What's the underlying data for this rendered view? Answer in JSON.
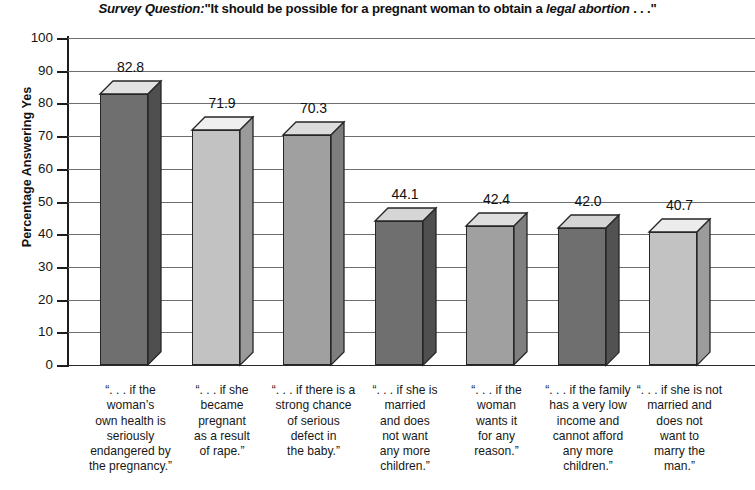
{
  "chart_data": {
    "type": "bar",
    "title_parts": {
      "lead": "Survey Question:",
      "quote_open": "\"It should be possible for a pregnant woman to obtain a ",
      "emphasis": "legal abortion",
      "quote_close": " . . .\""
    },
    "xlabel": "",
    "ylabel": "Percentage Answering Yes",
    "ylim": [
      0,
      100
    ],
    "ytick_step": 10,
    "yticks": [
      100,
      90,
      80,
      70,
      60,
      50,
      40,
      30,
      20,
      10,
      0
    ],
    "grid": true,
    "legend": "none",
    "categories": [
      "“. . . if the woman’s own health is seriously endangered by the pregnancy.”",
      "“. . . if she became pregnant as a result of rape.”",
      "“. . . if there is a strong chance of serious defect in the baby.”",
      "“. . . if she is married and does not want any more children.”",
      "“. . . if the woman wants it for any reason.”",
      "“. . . if the family has a very low income and cannot afford any more children.”",
      "“. . . if she is not married and does not want to marry the man.”"
    ],
    "category_lines": [
      [
        "“. . . if the",
        "woman’s",
        "own health is",
        "seriously",
        "endangered by",
        "the pregnancy.”"
      ],
      [
        "“. . . if she",
        "became",
        "pregnant",
        "as a result",
        "of rape.”"
      ],
      [
        "“. . . if there is a",
        "strong chance",
        "of serious",
        "defect in",
        "the baby.”"
      ],
      [
        "“. . . if she is",
        "married",
        "and does",
        "not want",
        "any more",
        "children.”"
      ],
      [
        "“. . . if the",
        "woman",
        "wants it",
        "for any",
        "reason.”"
      ],
      [
        "“. . . if the family",
        "has a very low",
        "income and",
        "cannot afford",
        "any more",
        "children.”"
      ],
      [
        "“. . . if she is not",
        "married and",
        "does not",
        "want to",
        "marry the",
        "man.”"
      ]
    ],
    "values": [
      82.8,
      71.9,
      70.3,
      44.1,
      42.4,
      42.0,
      40.7
    ],
    "value_labels": [
      "82.8",
      "71.9",
      "70.3",
      "44.1",
      "42.4",
      "42.0",
      "40.7"
    ],
    "bar_colors": [
      "#6f6f6f",
      "#c2c2c2",
      "#a0a0a0",
      "#6f6f6f",
      "#a0a0a0",
      "#6f6f6f",
      "#c2c2c2"
    ],
    "bar_top_colors": [
      "#e2e2e2",
      "#efefef",
      "#dcdcdc",
      "#d6d6d6",
      "#dedede",
      "#d4d4d4",
      "#ececec"
    ],
    "bar_side_colors": [
      "#4f4f4f",
      "#9a9a9a",
      "#7d7d7d",
      "#4f4f4f",
      "#7f7f7f",
      "#525252",
      "#9c9c9c"
    ],
    "axis_color": "#1d1d1d",
    "gridline_color": "#6e6e6e",
    "background": "#ffffff"
  }
}
